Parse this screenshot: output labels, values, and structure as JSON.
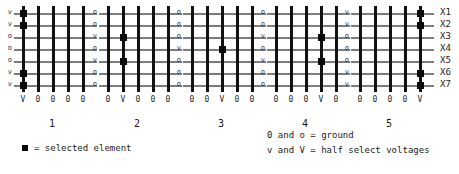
{
  "diagram": {
    "rows": 7,
    "cols": 5,
    "row_axis_labels": [
      "X1",
      "X2",
      "X3",
      "X4",
      "X5",
      "X6",
      "X7"
    ],
    "panels": [
      {
        "number": "1",
        "row_labels": [
          "v",
          "v",
          "o",
          "o",
          "o",
          "v",
          "v"
        ],
        "col_labels": [
          "V",
          "0",
          "0",
          "0",
          "0"
        ],
        "selected": [
          [
            1,
            1
          ],
          [
            2,
            1
          ],
          [
            6,
            1
          ],
          [
            7,
            1
          ]
        ]
      },
      {
        "number": "2",
        "row_labels": [
          "o",
          "o",
          "v",
          "o",
          "v",
          "o",
          "o"
        ],
        "col_labels": [
          "0",
          "V",
          "0",
          "0",
          "0"
        ],
        "selected": [
          [
            3,
            2
          ],
          [
            5,
            2
          ]
        ]
      },
      {
        "number": "3",
        "row_labels": [
          "o",
          "o",
          "o",
          "v",
          "o",
          "o",
          "o"
        ],
        "col_labels": [
          "0",
          "0",
          "V",
          "0",
          "0"
        ],
        "selected": [
          [
            4,
            3
          ]
        ]
      },
      {
        "number": "4",
        "row_labels": [
          "o",
          "o",
          "v",
          "o",
          "v",
          "o",
          "o"
        ],
        "col_labels": [
          "0",
          "0",
          "0",
          "V",
          "0"
        ],
        "selected": [
          [
            3,
            4
          ],
          [
            5,
            4
          ]
        ]
      },
      {
        "number": "5",
        "row_labels": [
          "v",
          "v",
          "o",
          "o",
          "o",
          "v",
          "v"
        ],
        "col_labels": [
          "0",
          "0",
          "0",
          "0",
          "V"
        ],
        "selected": [
          [
            1,
            5
          ],
          [
            2,
            5
          ],
          [
            6,
            5
          ],
          [
            7,
            5
          ]
        ]
      }
    ]
  },
  "legend": {
    "selected_element": "= selected element",
    "ground": "0 and o = ground",
    "half_select": "v and V = half select voltages"
  },
  "colors": {
    "wire_vertical": "#121212",
    "wire_horizontal": "#7d7d7d",
    "node": "#0a0a0a",
    "background": "#ffffff"
  }
}
